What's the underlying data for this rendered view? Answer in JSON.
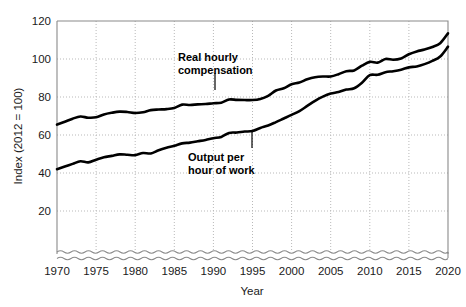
{
  "chart_data": {
    "type": "line",
    "title": "",
    "xlabel": "Year",
    "ylabel": "Index (2012 = 100)",
    "xlim": [
      1970,
      2020
    ],
    "ylim": [
      20,
      120
    ],
    "y_axis_break": true,
    "grid": true,
    "legend_position": "inline-annotations",
    "x_ticks": [
      "1970",
      "1975",
      "1980",
      "1985",
      "1990",
      "1995",
      "2000",
      "2005",
      "2010",
      "2015",
      "2020"
    ],
    "y_ticks": [
      "20",
      "40",
      "60",
      "80",
      "100",
      "120"
    ],
    "x": [
      1970,
      1971,
      1972,
      1973,
      1974,
      1975,
      1976,
      1977,
      1978,
      1979,
      1980,
      1981,
      1982,
      1983,
      1984,
      1985,
      1986,
      1987,
      1988,
      1989,
      1990,
      1991,
      1992,
      1993,
      1994,
      1995,
      1996,
      1997,
      1998,
      1999,
      2000,
      2001,
      2002,
      2003,
      2004,
      2005,
      2006,
      2007,
      2008,
      2009,
      2010,
      2011,
      2012,
      2013,
      2014,
      2015,
      2016,
      2017,
      2018,
      2019,
      2020
    ],
    "series": [
      {
        "name": "Real hourly compensation",
        "label_line1": "Real hourly",
        "label_line2": "compensation",
        "color": "#000000",
        "values": [
          65.5,
          67.0,
          68.6,
          69.7,
          69.1,
          69.3,
          70.8,
          71.7,
          72.3,
          72.1,
          71.6,
          72.0,
          73.1,
          73.4,
          73.6,
          74.2,
          76.0,
          75.8,
          76.1,
          76.3,
          76.7,
          77.0,
          78.7,
          78.5,
          78.4,
          78.4,
          79.0,
          80.6,
          83.4,
          84.6,
          86.7,
          87.6,
          89.3,
          90.4,
          90.8,
          90.8,
          92.0,
          93.6,
          94.0,
          96.5,
          98.5,
          98.1,
          100.0,
          99.6,
          100.3,
          102.5,
          104.0,
          105.0,
          106.3,
          108.3,
          113.5
        ]
      },
      {
        "name": "Output per hour of work",
        "label_line1": "Output per",
        "label_line2": "hour of work",
        "color": "#000000",
        "values": [
          42.0,
          43.4,
          44.8,
          46.2,
          45.6,
          47.0,
          48.3,
          49.0,
          49.8,
          49.6,
          49.4,
          50.5,
          50.3,
          52.0,
          53.3,
          54.3,
          55.6,
          56.0,
          56.7,
          57.4,
          58.3,
          59.0,
          61.1,
          61.3,
          61.8,
          62.1,
          63.7,
          65.0,
          66.8,
          68.7,
          70.6,
          72.6,
          75.3,
          78.0,
          80.2,
          81.8,
          82.6,
          83.9,
          84.6,
          87.5,
          91.5,
          91.7,
          93.0,
          93.6,
          94.4,
          95.6,
          96.1,
          97.3,
          99.0,
          101.3,
          106.5
        ]
      }
    ],
    "annotations": [
      {
        "text": "Real hourly compensation",
        "target_year": 1991,
        "target_value": 77.0
      },
      {
        "text": "Output per hour of work",
        "target_year": 1995,
        "target_value": 62.1
      }
    ]
  }
}
